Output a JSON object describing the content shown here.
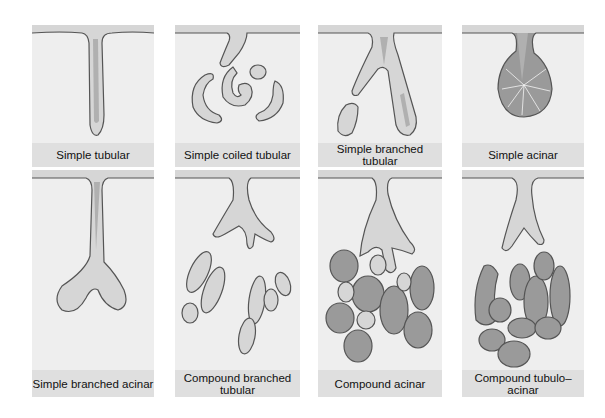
{
  "figure": {
    "colors": {
      "background": "#ffffff",
      "panel_fill": "#eeeeee",
      "caption_fill": "#dfdfdf",
      "outline": "#555555",
      "epithelium_light": "#d6d6d6",
      "lumen": "#b4b4b4",
      "acinus_dark": "#9a9a9a",
      "cell_lines": "#f4f4f4"
    },
    "panels": [
      {
        "label": "Simple tubular"
      },
      {
        "label": "Simple coiled tubular"
      },
      {
        "label": "Simple branched tubular"
      },
      {
        "label": "Simple acinar"
      },
      {
        "label": "Simple branched acinar"
      },
      {
        "label": "Compound branched tubular"
      },
      {
        "label": "Compound acinar"
      },
      {
        "label": "Compound tubulo–acinar"
      }
    ]
  }
}
